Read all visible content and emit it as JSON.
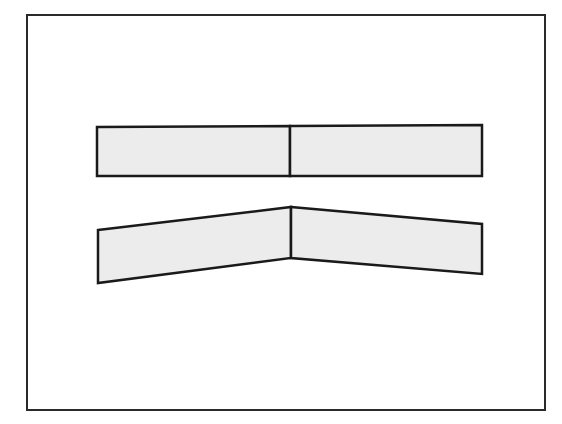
{
  "diagram": {
    "background": "#ffffff",
    "frame": {
      "x": 27,
      "y": 15,
      "width": 518,
      "height": 395,
      "stroke": "#2a2a2a",
      "stroke_width": 2
    },
    "fill_color": "#ececec",
    "stroke_color": "#1a1a1a",
    "flat_strip": {
      "left_panel": [
        [
          97,
          127
        ],
        [
          290,
          126
        ],
        [
          290,
          176
        ],
        [
          97,
          176
        ]
      ],
      "right_panel": [
        [
          290,
          126
        ],
        [
          482,
          125
        ],
        [
          482,
          176
        ],
        [
          290,
          176
        ]
      ],
      "divider": [
        [
          290,
          126
        ],
        [
          290,
          176
        ]
      ]
    },
    "bent_strip": {
      "left_panel": [
        [
          98,
          230
        ],
        [
          291,
          207
        ],
        [
          291,
          258
        ],
        [
          98,
          283
        ]
      ],
      "right_panel": [
        [
          291,
          207
        ],
        [
          482,
          224
        ],
        [
          482,
          274
        ],
        [
          291,
          258
        ]
      ],
      "divider": [
        [
          291,
          207
        ],
        [
          291,
          258
        ]
      ]
    }
  }
}
